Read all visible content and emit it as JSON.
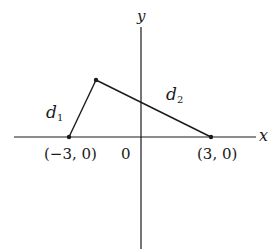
{
  "diagram": {
    "axes": {
      "x_label": "x",
      "y_label": "y",
      "origin_label": "0"
    },
    "points": [
      {
        "name": "left-focus",
        "label": "(−3, 0)"
      },
      {
        "name": "right-focus",
        "label": "(3, 0)"
      },
      {
        "name": "point-on-curve",
        "label": ""
      }
    ],
    "segments": [
      {
        "name": "d1",
        "label": "d",
        "sub": "1"
      },
      {
        "name": "d2",
        "label": "d",
        "sub": "2"
      }
    ],
    "colors": {
      "ink": "#1a1a1a",
      "background": "#ffffff"
    }
  }
}
